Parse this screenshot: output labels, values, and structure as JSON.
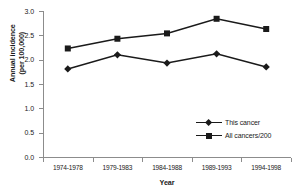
{
  "chart_data": {
    "type": "line",
    "title": "",
    "xlabel": "Year",
    "ylabel_line1": "Annual incidence",
    "ylabel_line2": "(per 100,000)",
    "categories": [
      "1974-1978",
      "1979-1983",
      "1984-1988",
      "1989-1993",
      "1994-1998"
    ],
    "ylim": [
      0.0,
      3.0
    ],
    "ytick_labels": [
      "0.0",
      "0.5",
      "1.0",
      "1.5",
      "2.0",
      "2.5",
      "3.0"
    ],
    "ytick_values": [
      0.0,
      0.5,
      1.0,
      1.5,
      2.0,
      2.5,
      3.0
    ],
    "grid": false,
    "legend_position": "lower-right-inside",
    "series": [
      {
        "name": "This cancer",
        "marker": "diamond",
        "color": "#1a1a1a",
        "values": [
          1.81,
          2.1,
          1.93,
          2.12,
          1.85
        ]
      },
      {
        "name": "All cancers/200",
        "marker": "square",
        "color": "#1a1a1a",
        "values": [
          2.23,
          2.43,
          2.54,
          2.84,
          2.63
        ]
      }
    ]
  },
  "axis_color": "#8c8c8c",
  "plot_background": "#ffffff"
}
